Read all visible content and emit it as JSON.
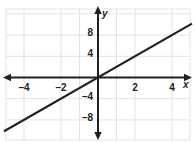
{
  "chart_data": {
    "type": "line",
    "title": "",
    "xlabel": "x",
    "ylabel": "y",
    "xlim": [
      -5,
      5
    ],
    "ylim": [
      -11,
      11
    ],
    "grid": true,
    "legend": null,
    "x_ticks": [
      -4,
      -2,
      2,
      4
    ],
    "y_ticks": [
      8,
      4,
      -4,
      -8
    ],
    "x_tick_labels": [
      "–4",
      "–2",
      "2",
      "4"
    ],
    "y_tick_labels": [
      "8",
      "4",
      "–4",
      "–8"
    ],
    "series": [
      {
        "name": "line",
        "equation": "y = 2x",
        "slope": 2,
        "intercept": 0,
        "x": [
          -5,
          5
        ],
        "values": [
          -10,
          10
        ],
        "color": "#231f20"
      }
    ],
    "axis_color": "#231f20",
    "grid_color": "#e3e3e6",
    "background": "#ffffff"
  },
  "axes": {
    "x_label": "x",
    "y_label": "y"
  },
  "ticks": {
    "x": [
      {
        "label": "–4",
        "value": -4
      },
      {
        "label": "–2",
        "value": -2
      },
      {
        "label": "2",
        "value": 2
      },
      {
        "label": "4",
        "value": 4
      }
    ],
    "y": [
      {
        "label": "8",
        "value": 8
      },
      {
        "label": "4",
        "value": 4
      },
      {
        "label": "–4",
        "value": -4
      },
      {
        "label": "–8",
        "value": -8
      }
    ]
  }
}
